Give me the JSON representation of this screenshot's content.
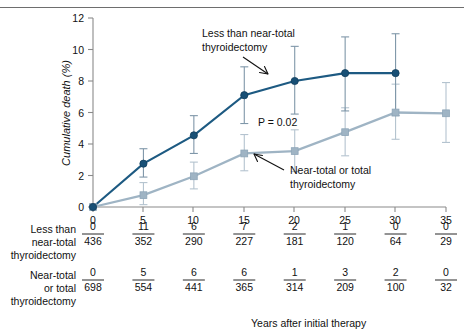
{
  "chart_data": {
    "type": "line",
    "title": "",
    "xlabel": "Years after initial therapy",
    "ylabel": "Cumulative death (%)",
    "xlim": [
      0,
      35
    ],
    "ylim": [
      0,
      12
    ],
    "xticks": [
      0,
      5,
      10,
      15,
      20,
      25,
      30,
      35
    ],
    "yticks": [
      0,
      2,
      4,
      6,
      8,
      10,
      12
    ],
    "grid": false,
    "legend_position": "inline-annotations",
    "annotations": [
      {
        "text": "P = 0.02",
        "x": 17.5,
        "y": 5.2
      }
    ],
    "series": [
      {
        "name": "Less than near-total thyroidectomy",
        "color": "#185076",
        "marker": "circle",
        "x": [
          0,
          5,
          10,
          15,
          20,
          25,
          30
        ],
        "values": [
          0,
          2.75,
          4.55,
          7.1,
          8.0,
          8.5,
          8.5
        ],
        "err_low": [
          0,
          1.9,
          3.4,
          5.3,
          5.9,
          6.1,
          5.8
        ],
        "err_high": [
          0,
          3.7,
          5.8,
          8.9,
          10.2,
          10.8,
          11.0
        ]
      },
      {
        "name": "Near-total or total thyroidectomy",
        "color": "#9fb4c4",
        "marker": "square",
        "x": [
          0,
          5,
          10,
          15,
          20,
          25,
          30,
          35
        ],
        "values": [
          0,
          0.75,
          1.95,
          3.4,
          3.55,
          4.75,
          6.0,
          5.95
        ],
        "err_low": [
          0,
          0.15,
          1.15,
          2.3,
          2.25,
          3.25,
          4.3,
          4.1
        ],
        "err_high": [
          0,
          1.55,
          2.85,
          4.6,
          4.9,
          6.3,
          7.8,
          7.9
        ]
      }
    ],
    "annotation_labels": [
      {
        "name": "less-than-near-total",
        "line1": "Less than near-total",
        "line2": "thyroidectomy"
      },
      {
        "name": "near-total-or-total",
        "line1": "Near-total or total",
        "line2": "thyroidectomy"
      }
    ]
  },
  "risk_table": {
    "columns": [
      0,
      5,
      10,
      15,
      20,
      25,
      30,
      35
    ],
    "rows": [
      {
        "label_lines": [
          "Less than",
          "near-total",
          "thyroidectomy"
        ],
        "numerators": [
          "0",
          "11",
          "6",
          "7",
          "2",
          "1",
          "0",
          "0"
        ],
        "denominators": [
          "436",
          "352",
          "290",
          "227",
          "181",
          "120",
          "64",
          "29"
        ]
      },
      {
        "label_lines": [
          "Near-total",
          "or total",
          "thyroidectomy"
        ],
        "numerators": [
          "0",
          "5",
          "6",
          "6",
          "1",
          "3",
          "2",
          "0"
        ],
        "denominators": [
          "698",
          "554",
          "441",
          "365",
          "314",
          "209",
          "100",
          "32"
        ]
      }
    ]
  }
}
